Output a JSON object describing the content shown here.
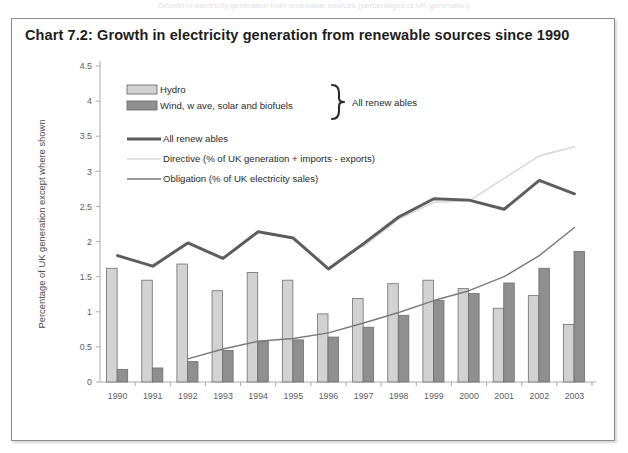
{
  "clipped_top_text": "Growth in electricity generation from renewable sources (percentages of UK generation)",
  "chart": {
    "title": "Chart 7.2:  Growth in electricity generation from renewable sources since 1990",
    "brace_label": "All renew ables",
    "colors": {
      "hydro": "#d2d2d2",
      "wind": "#8f8f8f",
      "all_renewables_line": "#5d5d5d",
      "directive_line": "#d9d9d9",
      "obligation_line": "#7a7a7a",
      "axis": "#aaaaaa",
      "frame": "#8d8d8d",
      "text": "#2b2b2b"
    }
  },
  "chart_data": {
    "type": "bar",
    "title": "Chart 7.2:  Growth in electricity generation from renewable sources since 1990",
    "xlabel": "",
    "ylabel": "Percentage of UK generation except where shown",
    "ylim": [
      0,
      4.5
    ],
    "yticks": [
      "0",
      "0.5",
      "1",
      "1.5",
      "2",
      "2.5",
      "3",
      "3.5",
      "4",
      "4.5"
    ],
    "ytick_values": [
      0,
      0.5,
      1,
      1.5,
      2,
      2.5,
      3,
      3.5,
      4,
      4.5
    ],
    "grid": false,
    "legend_position": "top-left",
    "categories": [
      "1990",
      "1991",
      "1992",
      "1993",
      "1994",
      "1995",
      "1996",
      "1997",
      "1998",
      "1999",
      "2000",
      "2001",
      "2002",
      "2003"
    ],
    "series": [
      {
        "name": "Hydro",
        "type": "bar",
        "color": "#d2d2d2",
        "values": [
          1.62,
          1.45,
          1.68,
          1.3,
          1.56,
          1.45,
          0.97,
          1.19,
          1.4,
          1.45,
          1.33,
          1.05,
          1.23,
          0.82
        ]
      },
      {
        "name": "Wind, w ave, solar and biofuels",
        "type": "bar",
        "color": "#8f8f8f",
        "values": [
          0.18,
          0.2,
          0.29,
          0.45,
          0.58,
          0.6,
          0.64,
          0.78,
          0.95,
          1.16,
          1.26,
          1.41,
          1.62,
          1.86
        ]
      },
      {
        "name": "All renew ables",
        "type": "line",
        "color": "#5d5d5d",
        "width": 3,
        "values": [
          1.8,
          1.65,
          1.98,
          1.76,
          2.14,
          2.05,
          1.61,
          1.97,
          2.35,
          2.61,
          2.59,
          2.46,
          2.87,
          2.68
        ]
      },
      {
        "name": "Directive (% of UK generation + imports - exports)",
        "type": "line",
        "color": "#d9d9d9",
        "width": 1.6,
        "values": [
          null,
          null,
          null,
          null,
          null,
          null,
          null,
          1.93,
          2.32,
          2.56,
          2.58,
          2.9,
          3.22,
          3.35
        ]
      },
      {
        "name": "Obligation (% of UK electricity sales)",
        "type": "line",
        "color": "#7a7a7a",
        "width": 1.4,
        "values": [
          null,
          null,
          0.33,
          0.47,
          0.58,
          0.62,
          0.7,
          0.84,
          0.99,
          1.16,
          1.3,
          1.5,
          1.8,
          2.2
        ]
      }
    ],
    "legend_entries": [
      {
        "label": "Hydro",
        "marker": "swatch",
        "color": "#d2d2d2"
      },
      {
        "label": "Wind, w ave, solar and biofuels",
        "marker": "swatch",
        "color": "#8f8f8f"
      },
      {
        "label": "All renew ables",
        "marker": "line",
        "color": "#5d5d5d"
      },
      {
        "label": "Directive (% of UK generation + imports - exports)",
        "marker": "line",
        "color": "#d9d9d9"
      },
      {
        "label": "Obligation (% of UK electricity sales)",
        "marker": "line",
        "color": "#7a7a7a"
      }
    ],
    "annotations": [
      {
        "text": "All renew ables",
        "kind": "brace-label"
      }
    ]
  }
}
